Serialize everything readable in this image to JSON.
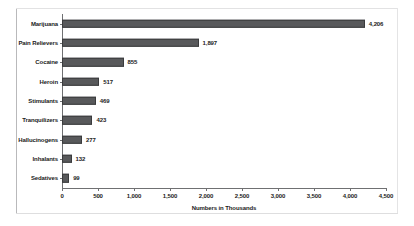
{
  "chart_data": {
    "type": "bar",
    "orientation": "horizontal",
    "title": "",
    "xlabel": "Numbers in Thousands",
    "ylabel": "",
    "categories": [
      "Marijuana",
      "Pain Relievers",
      "Cocaine",
      "Heroin",
      "Stimulants",
      "Tranquilizers",
      "Hallucinogens",
      "Inhalants",
      "Sedatives"
    ],
    "values": [
      4206,
      1897,
      855,
      517,
      469,
      423,
      277,
      132,
      99
    ],
    "value_labels": [
      "4,206",
      "1,897",
      "855",
      "517",
      "469",
      "423",
      "277",
      "132",
      "99"
    ],
    "xlim": [
      0,
      4500
    ],
    "xticks": [
      0,
      500,
      1000,
      1500,
      2000,
      2500,
      3000,
      3500,
      4000,
      4500
    ],
    "xtick_labels": [
      "0",
      "500",
      "1,000",
      "1,500",
      "2,000",
      "2,500",
      "3,000",
      "3,500",
      "4,000",
      "4,500"
    ],
    "grid": false,
    "legend": null,
    "bar_color": "#58595b",
    "bar_border_color": "#3a3b3d",
    "axis_color": "#6f7072",
    "background_color": "#ffffff"
  }
}
